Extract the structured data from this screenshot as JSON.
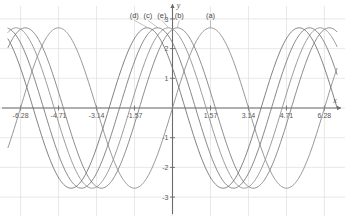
{
  "chart_data": {
    "type": "line",
    "title": "",
    "xlabel": "x",
    "ylabel": "y",
    "xlim": [
      -6.8,
      6.8
    ],
    "ylim": [
      -3.3,
      3.3
    ],
    "grid": true,
    "grid_color": "#e2e2e2",
    "axis_color": "#6b6b6b",
    "legend": "inline-labels",
    "xticks": [
      -6.28,
      -4.71,
      -3.14,
      -1.57,
      1.57,
      3.14,
      4.71,
      6.28
    ],
    "xtick_labels": [
      "-6.28",
      "-4.71",
      "-3.14",
      "-1.57",
      "1.57",
      "3.14",
      "4.71",
      "6.28"
    ],
    "yticks": [
      3,
      2,
      1,
      -1,
      -2,
      -3
    ],
    "ytick_labels": [
      "3",
      "2",
      "1",
      "-1",
      "-2",
      "-3"
    ],
    "amplitude": 2.7,
    "period": 6.283185307,
    "series": [
      {
        "name": "(a)",
        "label": "(a)",
        "color": "#8a8a8a",
        "amplitude": 2.7,
        "phase": 1.5708,
        "peak_x": 1.57,
        "peak_y": 2.7,
        "label_x": 1.57,
        "label_y": 3.02
      },
      {
        "name": "(b)",
        "label": "(b)",
        "color": "#7e7e7e",
        "amplitude": 2.7,
        "phase": 0.2,
        "peak_x": 0.2,
        "peak_y": 2.7,
        "label_x": 0.28,
        "label_y": 3.02
      },
      {
        "name": "(e)",
        "label": "(e)",
        "color": "#8f8f8f",
        "amplitude": 2.7,
        "phase": -0.18,
        "peak_x": -0.18,
        "peak_y": 2.7,
        "label_x": -0.44,
        "label_y": 3.02
      },
      {
        "name": "(c)",
        "label": "(c)",
        "color": "#787878",
        "amplitude": 2.7,
        "phase": -0.62,
        "peak_x": -0.62,
        "peak_y": 2.7,
        "label_x": -1.02,
        "label_y": 3.02
      },
      {
        "name": "(d)",
        "label": "(d)",
        "color": "#717171",
        "amplitude": 2.7,
        "phase": -1.05,
        "peak_x": -1.05,
        "peak_y": 2.7,
        "label_x": -1.58,
        "label_y": 3.02
      }
    ]
  },
  "axes": {
    "x_axis_name": "x",
    "y_axis_name": "y"
  }
}
